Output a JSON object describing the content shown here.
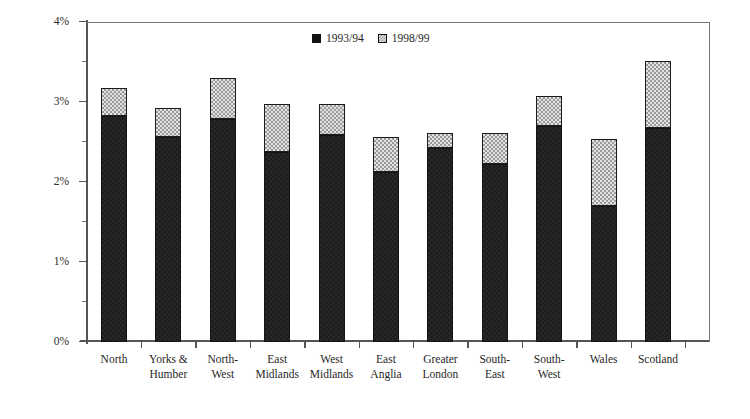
{
  "chart_data": {
    "type": "bar",
    "subtype": "stacked",
    "title": "",
    "xlabel": "",
    "ylabel": "percentage of gross income",
    "ylim": [
      0,
      4
    ],
    "ytick_labels": [
      "0%",
      "1%",
      "2%",
      "3%",
      "4%"
    ],
    "ytick_values": [
      0,
      1,
      2,
      3,
      4
    ],
    "yminor_values": [
      0.5,
      1.5,
      2.5,
      3.5
    ],
    "grid": false,
    "legend_position": "top-center",
    "categories": [
      "North",
      "Yorks & Humber",
      "North-West",
      "East Midlands",
      "West Midlands",
      "East Anglia",
      "Greater London",
      "South-East",
      "South-West",
      "Wales",
      "Scotland"
    ],
    "category_lines": [
      [
        "North"
      ],
      [
        "Yorks &",
        "Humber"
      ],
      [
        "North-",
        "West"
      ],
      [
        "East",
        "Midlands"
      ],
      [
        "West",
        "Midlands"
      ],
      [
        "East",
        "Anglia"
      ],
      [
        "Greater",
        "London"
      ],
      [
        "South-",
        "East"
      ],
      [
        "South-",
        "West"
      ],
      [
        "Wales"
      ],
      [
        "Scotland"
      ]
    ],
    "series": [
      {
        "name": "1993/94",
        "color": "#1c1c1c",
        "values": [
          2.83,
          2.56,
          2.79,
          2.38,
          2.59,
          2.13,
          2.43,
          2.23,
          2.7,
          1.7,
          2.68
        ]
      },
      {
        "name": "1998/99",
        "color": "#e3e3e3",
        "values": [
          0.34,
          0.37,
          0.51,
          0.6,
          0.39,
          0.43,
          0.18,
          0.38,
          0.38,
          0.84,
          0.83
        ]
      }
    ],
    "totals": [
      3.17,
      2.93,
      3.3,
      2.98,
      2.98,
      2.56,
      2.61,
      2.61,
      3.08,
      2.54,
      3.51
    ]
  },
  "legend": {
    "items": [
      {
        "label": "1993/94",
        "swatch": "dark-solid-swatch-icon"
      },
      {
        "label": "1998/99",
        "swatch": "light-checker-swatch-icon"
      }
    ]
  }
}
